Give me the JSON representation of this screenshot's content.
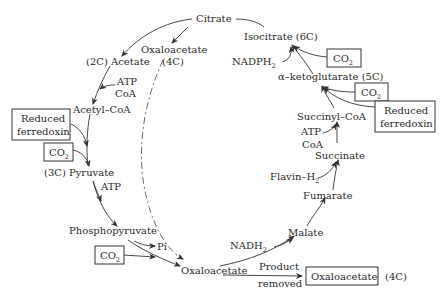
{
  "diagram": {
    "nodes": {
      "citrate": "Citrate",
      "isocitrate": "Isocitrate (6C)",
      "nadph": "NADPH",
      "nadph_sub": "2",
      "akg": "α–ketoglutarate (5C)",
      "succinyl_coa": "Succinyl–CoA",
      "atp_coa_right_1": "ATP",
      "atp_coa_right_2": "CoA",
      "succinate": "Succinate",
      "flavin": "Flavin–H",
      "flavin_sub": "2",
      "fumarate": "Fumarate",
      "malate": "Malate",
      "nadh": "NADH",
      "nadh_sub": "2",
      "oxaloacetate_bottom": "Oxaloacetate",
      "product_1": "Product",
      "product_2": "removed",
      "oxaloacetate_box": "Oxaloacetate",
      "oxaloacetate_box_c": "(4C)",
      "oxaloacetate_top": "Oxaloacetate",
      "oxaloacetate_top_c": "(4C)",
      "acetate": "(2C) Acetate",
      "atp_coa_left_1": "ATP",
      "atp_coa_left_2": "CoA",
      "acetyl_coa": "Acetyl–CoA",
      "reduced_ferredoxin_left_1": "Reduced",
      "reduced_ferredoxin_left_2": "ferredoxin",
      "co2_left": "CO",
      "co2_left_sub": "2",
      "pyruvate": "(3C) Pyruvate",
      "atp_left": "ATP",
      "phosphopyruvate": "Phosphopyruvate",
      "pi": "Pi",
      "co2_bottom": "CO",
      "co2_bottom_sub": "2",
      "co2_top_right": "CO",
      "co2_top_right_sub": "2",
      "co2_mid_right": "CO",
      "co2_mid_right_sub": "2",
      "reduced_ferredoxin_right_1": "Reduced",
      "reduced_ferredoxin_right_2": "ferredoxin"
    }
  }
}
